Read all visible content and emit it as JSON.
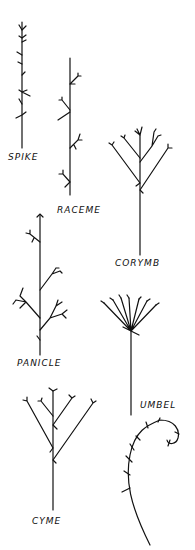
{
  "ink_color": "#111111",
  "background": "#ffffff",
  "labels": {
    "spike": "SPIKE",
    "raceme": "RACEME",
    "corymb": "CORYMB",
    "panicle": "PANICLE",
    "umbel": "UMBEL",
    "cyme": "CYME"
  },
  "figures": [
    {
      "name": "spike",
      "label": "SPIKE"
    },
    {
      "name": "raceme",
      "label": "RACEME"
    },
    {
      "name": "corymb",
      "label": "CORYMB"
    },
    {
      "name": "panicle",
      "label": "PANICLE"
    },
    {
      "name": "umbel",
      "label": "UMBEL"
    },
    {
      "name": "cyme",
      "label": "CYME"
    },
    {
      "name": "scorpioid-cyme",
      "label": ""
    }
  ]
}
